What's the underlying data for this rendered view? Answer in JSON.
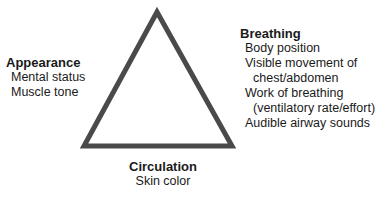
{
  "diagram": {
    "shape": "triangle",
    "stroke_color": "#4a4a4a",
    "appearance": {
      "title": "Appearance",
      "items": [
        "Mental status",
        "Muscle tone"
      ]
    },
    "breathing": {
      "title": "Breathing",
      "items": [
        "Body position",
        "Visible movement of",
        "chest/abdomen",
        "Work of breathing",
        "(ventilatory rate/effort)",
        "Audible airway sounds"
      ]
    },
    "circulation": {
      "title": "Circulation",
      "items": [
        "Skin color"
      ]
    }
  }
}
